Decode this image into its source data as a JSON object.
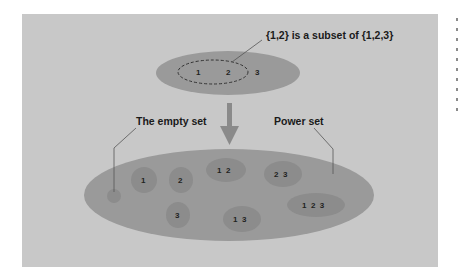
{
  "diagram": {
    "colors": {
      "background": "#c8c8c8",
      "ellipse_fill": "#9a9a9a",
      "subset_fill": "#8c8c8c",
      "arrow": "#8a8a8a",
      "line": "#555555",
      "text": "#1a1a1a"
    },
    "top_set": {
      "elements": [
        "1",
        "2",
        "3"
      ],
      "subset_elements": [
        "1",
        "2"
      ],
      "annotation": "{1,2} is a subset of {1,2,3}"
    },
    "labels": {
      "empty_set": "The empty set",
      "power_set": "Power set"
    },
    "power_set_subsets": [
      {
        "label": ""
      },
      {
        "label": "1"
      },
      {
        "label": "2"
      },
      {
        "label": "3"
      },
      {
        "label": "1  2"
      },
      {
        "label": "2  3"
      },
      {
        "label": "1  3"
      },
      {
        "label": "1  2  3"
      }
    ]
  }
}
